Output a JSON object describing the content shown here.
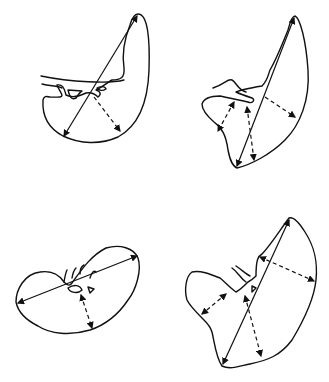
{
  "figure": {
    "description": "Four spleen outline drawings with measurement axes",
    "panels": [
      {
        "id": "top-left",
        "shape": "crescent spleen with hilar vessels",
        "solid_axis": "long axis (length)",
        "dashed_axes": 1
      },
      {
        "id": "top-right",
        "shape": "elongated spleen with anterior lobe",
        "solid_axis": "long axis (length)",
        "dashed_axes": 3
      },
      {
        "id": "bottom-left",
        "shape": "horizontal bean-shaped spleen",
        "solid_axis": "long axis (length)",
        "dashed_axes": 1
      },
      {
        "id": "bottom-right",
        "shape": "large lobulated spleen",
        "solid_axis": "long axis (length)",
        "dashed_axes": 3
      }
    ],
    "stroke_color": "#111111",
    "background": "#ffffff"
  }
}
